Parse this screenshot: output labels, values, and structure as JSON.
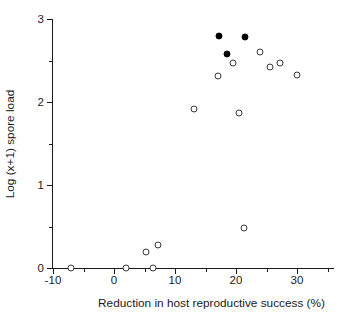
{
  "chart_data": {
    "type": "scatter",
    "title": "",
    "xlabel": "Reduction in host reproductive success (%)",
    "ylabel": "Log (x+1) spore load",
    "xlim": [
      -10,
      36
    ],
    "ylim": [
      0,
      3
    ],
    "xticks": [
      -10,
      0,
      10,
      20,
      30
    ],
    "xtick_labels": [
      "-10",
      "0",
      "10",
      "20",
      "30"
    ],
    "xticks_minor": [
      -5,
      5,
      15,
      25,
      35
    ],
    "yticks": [
      0,
      1,
      2,
      3
    ],
    "ytick_labels": [
      "0",
      "1",
      "2",
      "3"
    ],
    "yticks_minor": [
      0.5,
      1.5,
      2.5
    ],
    "grid": false,
    "legend": false,
    "series": [
      {
        "name": "open",
        "marker": "open-circle",
        "color": "#3a3a3a",
        "points": [
          {
            "x": -7.0,
            "y": 0.0
          },
          {
            "x": 2.0,
            "y": 0.0
          },
          {
            "x": 6.4,
            "y": 0.0
          },
          {
            "x": 5.3,
            "y": 0.19
          },
          {
            "x": 7.2,
            "y": 0.28
          },
          {
            "x": 21.3,
            "y": 0.48
          },
          {
            "x": 13.1,
            "y": 1.91
          },
          {
            "x": 20.5,
            "y": 1.87
          },
          {
            "x": 17.0,
            "y": 2.31
          },
          {
            "x": 30.0,
            "y": 2.33
          },
          {
            "x": 25.6,
            "y": 2.42
          },
          {
            "x": 27.2,
            "y": 2.47
          },
          {
            "x": 19.5,
            "y": 2.47
          },
          {
            "x": 23.9,
            "y": 2.6
          }
        ]
      },
      {
        "name": "filled",
        "marker": "filled-circle",
        "color": "#000000",
        "points": [
          {
            "x": 17.2,
            "y": 2.79
          },
          {
            "x": 21.5,
            "y": 2.78
          },
          {
            "x": 18.5,
            "y": 2.58
          }
        ]
      }
    ]
  }
}
